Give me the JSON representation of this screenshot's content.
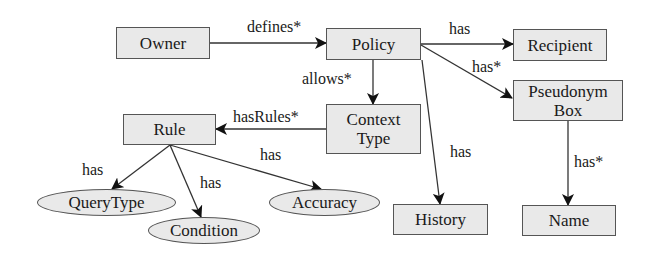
{
  "diagram": {
    "background": "#ffffff",
    "node_fill": "#e9e9e9",
    "stroke_color": "#555555",
    "nodes": {
      "owner": {
        "label": "Owner",
        "shape": "rectangle"
      },
      "policy": {
        "label": "Policy",
        "shape": "rectangle"
      },
      "recipient": {
        "label": "Recipient",
        "shape": "rectangle"
      },
      "pseudonym_box": {
        "label": "Pseudonym Box",
        "line1": "Pseudonym",
        "line2": "Box",
        "shape": "rectangle"
      },
      "context_type": {
        "label": "Context Type",
        "line1": "Context",
        "line2": "Type",
        "shape": "rectangle"
      },
      "rule": {
        "label": "Rule",
        "shape": "rectangle"
      },
      "history": {
        "label": "History",
        "shape": "rectangle"
      },
      "name": {
        "label": "Name",
        "shape": "rectangle"
      },
      "query_type": {
        "label": "QueryType",
        "shape": "ellipse"
      },
      "condition": {
        "label": "Condition",
        "shape": "ellipse"
      },
      "accuracy": {
        "label": "Accuracy",
        "shape": "ellipse"
      }
    },
    "edges": [
      {
        "from": "Owner",
        "to": "Policy",
        "label": "defines*"
      },
      {
        "from": "Policy",
        "to": "Recipient",
        "label": "has"
      },
      {
        "from": "Policy",
        "to": "Pseudonym Box",
        "label": "has*"
      },
      {
        "from": "Policy",
        "to": "Context Type",
        "label": "allows*"
      },
      {
        "from": "Policy",
        "to": "History",
        "label": "has"
      },
      {
        "from": "Context Type",
        "to": "Rule",
        "label": "hasRules*"
      },
      {
        "from": "Rule",
        "to": "QueryType",
        "label": "has"
      },
      {
        "from": "Rule",
        "to": "Condition",
        "label": "has"
      },
      {
        "from": "Rule",
        "to": "Accuracy",
        "label": "has"
      },
      {
        "from": "Pseudonym Box",
        "to": "Name",
        "label": "has*"
      }
    ]
  }
}
